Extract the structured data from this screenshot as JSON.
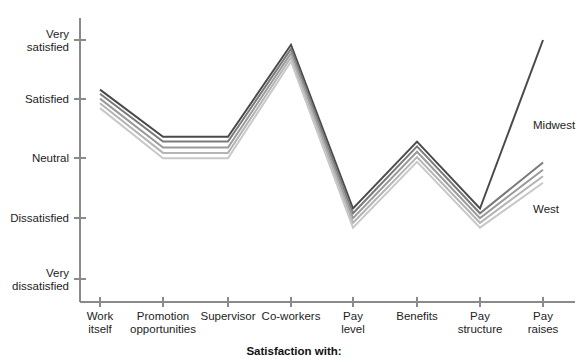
{
  "chart_data": {
    "type": "line",
    "title": "",
    "xlabel": "Satisfaction with:",
    "ylabel": "",
    "categories": [
      "Work itself",
      "Promotion opportunities",
      "Supervisor",
      "Co-workers",
      "Pay level",
      "Benefits",
      "Pay structure",
      "Pay raises"
    ],
    "category_lines": [
      [
        "Work",
        "itself"
      ],
      [
        "Promotion",
        "opportunities"
      ],
      [
        "Supervisor",
        ""
      ],
      [
        "Co-workers",
        ""
      ],
      [
        "Pay",
        "level"
      ],
      [
        "Benefits",
        ""
      ],
      [
        "Pay",
        "structure"
      ],
      [
        "Pay",
        "raises"
      ]
    ],
    "ytick_labels": [
      [
        "Very",
        "satisfied"
      ],
      [
        "Satisfied",
        ""
      ],
      [
        "Neutral",
        ""
      ],
      [
        "Dissatisfied",
        ""
      ],
      [
        "Very",
        "dissatisfied"
      ]
    ],
    "ytick_values": [
      5,
      4,
      3,
      2,
      1
    ],
    "ylim": [
      1,
      5
    ],
    "grid": false,
    "legend_position": "inline-right",
    "series": [
      {
        "name": "Midwest",
        "color": "#4a4a4a",
        "values": [
          4.17,
          3.38,
          3.38,
          4.92,
          2.18,
          3.3,
          2.18,
          5.0
        ]
      },
      {
        "name": "Region 2",
        "color": "#7a7a7a",
        "values": [
          4.1,
          3.3,
          3.3,
          4.85,
          2.1,
          3.22,
          2.1,
          2.95
        ]
      },
      {
        "name": "Region 3",
        "color": "#9a9a9a",
        "values": [
          4.02,
          3.2,
          3.2,
          4.78,
          2.02,
          3.13,
          2.02,
          2.83
        ]
      },
      {
        "name": "Region 4",
        "color": "#b4b4b4",
        "values": [
          3.94,
          3.11,
          3.11,
          4.71,
          1.94,
          3.04,
          1.94,
          2.72
        ]
      },
      {
        "name": "West",
        "color": "#c8c8c8",
        "values": [
          3.86,
          3.02,
          3.02,
          4.64,
          1.86,
          2.96,
          1.86,
          2.61
        ]
      }
    ],
    "annotations": [
      {
        "text": "Midwest",
        "x": 533,
        "y": 126
      },
      {
        "text": "West",
        "x": 533,
        "y": 210
      }
    ]
  },
  "axes": {
    "y_axis_name": "satisfaction-scale",
    "x_axis_name": "satisfaction-facet"
  },
  "top_strip": {
    "text": ""
  }
}
